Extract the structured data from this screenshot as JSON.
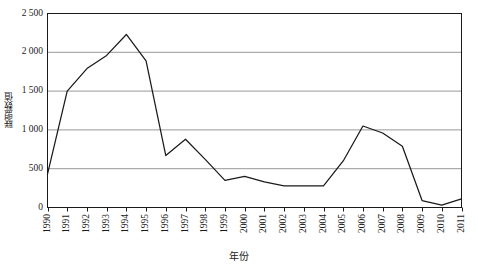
{
  "chart_data": {
    "type": "line",
    "title": "",
    "subtitle": "",
    "xlabel": "年份",
    "ylabel": "联盟数值",
    "categories": [
      "1990",
      "1991",
      "1992",
      "1993",
      "1994",
      "1995",
      "1996",
      "1997",
      "1998",
      "1999",
      "2000",
      "2001",
      "2002",
      "2003",
      "2004",
      "2005",
      "2006",
      "2007",
      "2008",
      "2009",
      "2010",
      "2011"
    ],
    "values": [
      430,
      1500,
      1790,
      1960,
      2230,
      1890,
      670,
      880,
      620,
      350,
      400,
      330,
      280,
      280,
      280,
      600,
      1050,
      960,
      790,
      90,
      30,
      110
    ],
    "series": [
      {
        "name": "联盟数值",
        "values": [
          430,
          1500,
          1790,
          1960,
          2230,
          1890,
          670,
          880,
          620,
          350,
          400,
          330,
          280,
          280,
          280,
          600,
          1050,
          960,
          790,
          90,
          30,
          110
        ],
        "color": "#1a1a1a"
      }
    ],
    "ylim": [
      0,
      2500
    ],
    "ytick_values": [
      0,
      500,
      1000,
      1500,
      2000,
      2500
    ],
    "ytick_labels": [
      "0",
      "500",
      "1 000",
      "1 500",
      "2 000",
      "2 500"
    ],
    "xtick_labels": [
      "1990",
      "1991",
      "1992",
      "1993",
      "1994",
      "1995",
      "1996",
      "1997",
      "1998",
      "1999",
      "2000",
      "2001",
      "2002",
      "2003",
      "2004",
      "2005",
      "2006",
      "2007",
      "2008",
      "2009",
      "2010",
      "2011"
    ],
    "grid": {
      "horizontal": true,
      "vertical": false,
      "color": "#8c8c8c"
    },
    "legend": {
      "visible": false,
      "position": "none",
      "entries": []
    },
    "annotations": [],
    "plot_border": true,
    "line_color": "#1a1a1a",
    "background_color": "#ffffff",
    "markers": false
  }
}
